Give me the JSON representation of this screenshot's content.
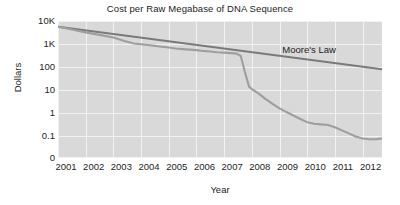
{
  "chart_data": {
    "type": "line",
    "title": "Cost per Raw Megabase of DNA Sequence",
    "xlabel": "Year",
    "ylabel": "Dollars",
    "yscale": "log",
    "ytick_labels": [
      "10K",
      "1K",
      "100",
      "10",
      "1",
      "0.1",
      "0"
    ],
    "ytick_values": [
      10000,
      1000,
      100,
      10,
      1,
      0.1,
      0
    ],
    "ylim": [
      0.04,
      10000
    ],
    "xlim": [
      2001,
      2012.7
    ],
    "xtick_labels": [
      "2001",
      "2002",
      "2003",
      "2004",
      "2005",
      "2006",
      "2007",
      "2008",
      "2009",
      "2010",
      "2011",
      "2012"
    ],
    "xtick_values": [
      2001,
      2002,
      2003,
      2004,
      2005,
      2006,
      2007,
      2008,
      2009,
      2010,
      2011,
      2012
    ],
    "grid": true,
    "plot_background": "#d9d9d9",
    "gridline_color": "#f2f2f2",
    "legend": "none",
    "annotations": [
      {
        "text": "Moore's Law",
        "x": 2011.05,
        "y": 260
      }
    ],
    "series": [
      {
        "name": "Moore's Law",
        "color": "#7a7a7a",
        "width": 2.1,
        "x": [
          2001.0,
          2012.7
        ],
        "values": [
          5600,
          80
        ]
      },
      {
        "name": "Cost per Raw Megabase of DNA Sequence",
        "color": "#9e9e9e",
        "width": 2.1,
        "x": [
          2001.0,
          2001.5,
          2002.0,
          2002.5,
          2003.0,
          2003.4,
          2003.75,
          2004.0,
          2004.25,
          2004.5,
          2004.75,
          2005.0,
          2005.25,
          2005.5,
          2005.75,
          2006.0,
          2006.25,
          2006.5,
          2006.75,
          2007.0,
          2007.25,
          2007.45,
          2007.6,
          2007.75,
          2007.9,
          2008.0,
          2008.25,
          2008.5,
          2008.75,
          2009.0,
          2009.25,
          2009.5,
          2009.75,
          2010.0,
          2010.25,
          2010.5,
          2010.75,
          2011.0,
          2011.25,
          2011.5,
          2011.75,
          2012.0,
          2012.25,
          2012.5,
          2012.7
        ],
        "values": [
          5600,
          4300,
          3200,
          2500,
          1900,
          1350,
          1050,
          980,
          900,
          830,
          760,
          700,
          640,
          600,
          570,
          540,
          500,
          470,
          440,
          420,
          400,
          380,
          300,
          60,
          14,
          11,
          7.0,
          4.0,
          2.5,
          1.6,
          1.1,
          0.78,
          0.55,
          0.4,
          0.34,
          0.32,
          0.3,
          0.24,
          0.175,
          0.13,
          0.095,
          0.078,
          0.072,
          0.073,
          0.078
        ]
      }
    ]
  }
}
